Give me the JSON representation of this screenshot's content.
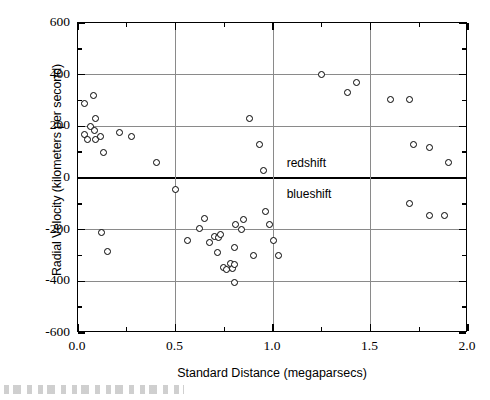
{
  "chart_data": {
    "type": "scatter",
    "title": "",
    "xlabel": "Standard Distance (megaparsecs)",
    "ylabel": "Radial Velocity (kilometers per second)",
    "xlim": [
      0.0,
      2.0
    ],
    "ylim": [
      -600,
      600
    ],
    "xticks": [
      "0.0",
      "0.5",
      "1.0",
      "1.5",
      "2.0"
    ],
    "xtick_values": [
      0.0,
      0.5,
      1.0,
      1.5,
      2.0
    ],
    "xminor_step": 0.25,
    "yticks": [
      "600",
      "400",
      "200",
      "0",
      "-200",
      "-400",
      "-600"
    ],
    "ytick_values": [
      600,
      400,
      200,
      0,
      -200,
      -400,
      -600
    ],
    "yminor_step": 100,
    "grid": "major gridlines on both axes, gray; zero line emphasized black",
    "legend": "none",
    "annotations": [
      {
        "text": "redshift",
        "x": 1.06,
        "y": 60,
        "name": "redshift-label"
      },
      {
        "text": "blueshift",
        "x": 1.06,
        "y": -60,
        "name": "blueshift-label"
      }
    ],
    "series": [
      {
        "name": "Nebulae",
        "marker": "open circle",
        "color": "#000000",
        "points": [
          [
            0.032,
            170
          ],
          [
            0.034,
            290
          ],
          [
            0.05,
            150
          ],
          [
            0.063,
            200
          ],
          [
            0.08,
            320
          ],
          [
            0.085,
            185
          ],
          [
            0.09,
            230
          ],
          [
            0.09,
            150
          ],
          [
            0.115,
            160
          ],
          [
            0.12,
            -210
          ],
          [
            0.13,
            100
          ],
          [
            0.15,
            -285
          ],
          [
            0.214,
            175
          ],
          [
            0.275,
            160
          ],
          [
            0.4,
            60
          ],
          [
            0.5,
            -45
          ],
          [
            0.56,
            -240
          ],
          [
            0.625,
            -195
          ],
          [
            0.65,
            -155
          ],
          [
            0.675,
            -250
          ],
          [
            0.7,
            -225
          ],
          [
            0.715,
            -290
          ],
          [
            0.72,
            -230
          ],
          [
            0.73,
            -220
          ],
          [
            0.745,
            -345
          ],
          [
            0.76,
            -355
          ],
          [
            0.78,
            -330
          ],
          [
            0.79,
            -350
          ],
          [
            0.8,
            -405
          ],
          [
            0.8,
            -270
          ],
          [
            0.805,
            -335
          ],
          [
            0.81,
            -180
          ],
          [
            0.84,
            -200
          ],
          [
            0.85,
            -160
          ],
          [
            0.88,
            230
          ],
          [
            0.9,
            -300
          ],
          [
            0.93,
            130
          ],
          [
            0.95,
            30
          ],
          [
            0.96,
            -130
          ],
          [
            0.98,
            -180
          ],
          [
            1.0,
            -240
          ],
          [
            1.03,
            -300
          ],
          [
            1.25,
            400
          ],
          [
            1.38,
            330
          ],
          [
            1.43,
            370
          ],
          [
            1.6,
            305
          ],
          [
            1.7,
            305
          ],
          [
            1.7,
            -100
          ],
          [
            1.72,
            130
          ],
          [
            1.8,
            -145
          ],
          [
            1.805,
            120
          ],
          [
            1.88,
            -145
          ],
          [
            1.9,
            60
          ]
        ]
      }
    ]
  },
  "figure": {
    "caption_partial": ""
  }
}
